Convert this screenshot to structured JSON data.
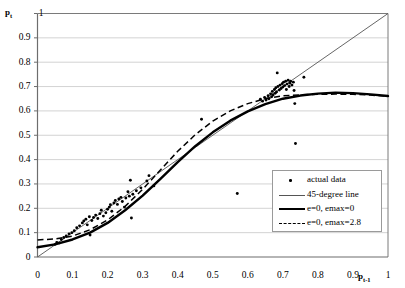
{
  "chart_data": {
    "type": "scatter",
    "title": "",
    "xlabel": "p t-1",
    "ylabel": "p t",
    "xlim": [
      0,
      1
    ],
    "ylim": [
      0,
      1
    ],
    "grid": "horizontal",
    "legend_position": "inside-lower-right",
    "xticks": [
      "0",
      "0.1",
      "0.2",
      "0.3",
      "0.4",
      "0.5",
      "0.6",
      "0.7",
      "0.8",
      "0.9",
      "1"
    ],
    "yticks": [
      "0",
      "0.1",
      "0.2",
      "0.3",
      "0.4",
      "0.5",
      "0.6",
      "0.7",
      "0.8",
      "0.9",
      "1"
    ],
    "legend": [
      {
        "label": "actual data",
        "key": "dot-marker"
      },
      {
        "label": "45-degree line",
        "key": "thin-line"
      },
      {
        "label": "e=0, emax=0",
        "key": "thick-line"
      },
      {
        "label": "e=0, emax=2.8",
        "key": "dashed-line"
      }
    ],
    "series": [
      {
        "name": "actual data",
        "type": "scatter",
        "marker": "dot",
        "color": "#000000",
        "points": [
          [
            0.05,
            0.052
          ],
          [
            0.055,
            0.06
          ],
          [
            0.062,
            0.058
          ],
          [
            0.068,
            0.072
          ],
          [
            0.075,
            0.08
          ],
          [
            0.082,
            0.086
          ],
          [
            0.09,
            0.095
          ],
          [
            0.098,
            0.1
          ],
          [
            0.105,
            0.108
          ],
          [
            0.112,
            0.12
          ],
          [
            0.12,
            0.128
          ],
          [
            0.128,
            0.14
          ],
          [
            0.132,
            0.148
          ],
          [
            0.138,
            0.155
          ],
          [
            0.142,
            0.132
          ],
          [
            0.148,
            0.165
          ],
          [
            0.15,
            0.09
          ],
          [
            0.155,
            0.15
          ],
          [
            0.16,
            0.162
          ],
          [
            0.166,
            0.172
          ],
          [
            0.172,
            0.158
          ],
          [
            0.178,
            0.178
          ],
          [
            0.182,
            0.192
          ],
          [
            0.188,
            0.168
          ],
          [
            0.195,
            0.182
          ],
          [
            0.2,
            0.196
          ],
          [
            0.205,
            0.205
          ],
          [
            0.208,
            0.215
          ],
          [
            0.212,
            0.188
          ],
          [
            0.218,
            0.222
          ],
          [
            0.222,
            0.232
          ],
          [
            0.228,
            0.216
          ],
          [
            0.232,
            0.238
          ],
          [
            0.238,
            0.245
          ],
          [
            0.242,
            0.228
          ],
          [
            0.248,
            0.205
          ],
          [
            0.252,
            0.242
          ],
          [
            0.258,
            0.268
          ],
          [
            0.262,
            0.25
          ],
          [
            0.265,
            0.315
          ],
          [
            0.268,
            0.16
          ],
          [
            0.272,
            0.258
          ],
          [
            0.282,
            0.272
          ],
          [
            0.295,
            0.284
          ],
          [
            0.312,
            0.312
          ],
          [
            0.318,
            0.334
          ],
          [
            0.332,
            0.292
          ],
          [
            0.468,
            0.566
          ],
          [
            0.57,
            0.261
          ],
          [
            0.636,
            0.648
          ],
          [
            0.642,
            0.64
          ],
          [
            0.648,
            0.655
          ],
          [
            0.652,
            0.645
          ],
          [
            0.658,
            0.662
          ],
          [
            0.66,
            0.65
          ],
          [
            0.665,
            0.67
          ],
          [
            0.668,
            0.658
          ],
          [
            0.67,
            0.68
          ],
          [
            0.672,
            0.665
          ],
          [
            0.676,
            0.688
          ],
          [
            0.678,
            0.672
          ],
          [
            0.68,
            0.695
          ],
          [
            0.682,
            0.678
          ],
          [
            0.684,
            0.756
          ],
          [
            0.686,
            0.7
          ],
          [
            0.69,
            0.686
          ],
          [
            0.692,
            0.706
          ],
          [
            0.695,
            0.692
          ],
          [
            0.698,
            0.712
          ],
          [
            0.7,
            0.698
          ],
          [
            0.702,
            0.718
          ],
          [
            0.705,
            0.704
          ],
          [
            0.708,
            0.722
          ],
          [
            0.71,
            0.688
          ],
          [
            0.712,
            0.71
          ],
          [
            0.715,
            0.726
          ],
          [
            0.718,
            0.7
          ],
          [
            0.72,
            0.714
          ],
          [
            0.722,
            0.722
          ],
          [
            0.726,
            0.706
          ],
          [
            0.73,
            0.718
          ],
          [
            0.732,
            0.684
          ],
          [
            0.734,
            0.63
          ],
          [
            0.736,
            0.466
          ],
          [
            0.76,
            0.738
          ]
        ]
      },
      {
        "name": "45-degree line",
        "type": "line",
        "style": "thin",
        "color": "#555555",
        "points": [
          [
            0,
            0
          ],
          [
            1,
            1
          ]
        ]
      },
      {
        "name": "e=0, emax=0",
        "type": "line",
        "style": "thick",
        "color": "#000000",
        "points": [
          [
            0.0,
            0.04
          ],
          [
            0.05,
            0.052
          ],
          [
            0.1,
            0.072
          ],
          [
            0.15,
            0.1
          ],
          [
            0.2,
            0.14
          ],
          [
            0.25,
            0.192
          ],
          [
            0.3,
            0.252
          ],
          [
            0.35,
            0.32
          ],
          [
            0.4,
            0.39
          ],
          [
            0.45,
            0.455
          ],
          [
            0.5,
            0.512
          ],
          [
            0.55,
            0.56
          ],
          [
            0.6,
            0.598
          ],
          [
            0.65,
            0.628
          ],
          [
            0.7,
            0.65
          ],
          [
            0.75,
            0.663
          ],
          [
            0.8,
            0.671
          ],
          [
            0.85,
            0.675
          ],
          [
            0.9,
            0.673
          ],
          [
            0.95,
            0.668
          ],
          [
            1.0,
            0.661
          ]
        ]
      },
      {
        "name": "e=0, emax=2.8",
        "type": "line",
        "style": "dashed",
        "color": "#000000",
        "points": [
          [
            0.0,
            0.07
          ],
          [
            0.05,
            0.074
          ],
          [
            0.1,
            0.086
          ],
          [
            0.15,
            0.112
          ],
          [
            0.2,
            0.152
          ],
          [
            0.25,
            0.208
          ],
          [
            0.3,
            0.278
          ],
          [
            0.35,
            0.356
          ],
          [
            0.4,
            0.434
          ],
          [
            0.45,
            0.502
          ],
          [
            0.5,
            0.558
          ],
          [
            0.55,
            0.6
          ],
          [
            0.6,
            0.63
          ],
          [
            0.65,
            0.65
          ],
          [
            0.7,
            0.662
          ],
          [
            0.75,
            0.666
          ],
          [
            0.8,
            0.668
          ],
          [
            0.85,
            0.669
          ],
          [
            0.9,
            0.668
          ],
          [
            0.95,
            0.665
          ],
          [
            1.0,
            0.66
          ]
        ]
      }
    ]
  },
  "colors": {
    "axis": "#7a7a7a",
    "grid": "#c8c8c8",
    "data": "#000000",
    "diagonal": "#555555",
    "legend_border": "#9a9a9a",
    "background": "#ffffff"
  }
}
